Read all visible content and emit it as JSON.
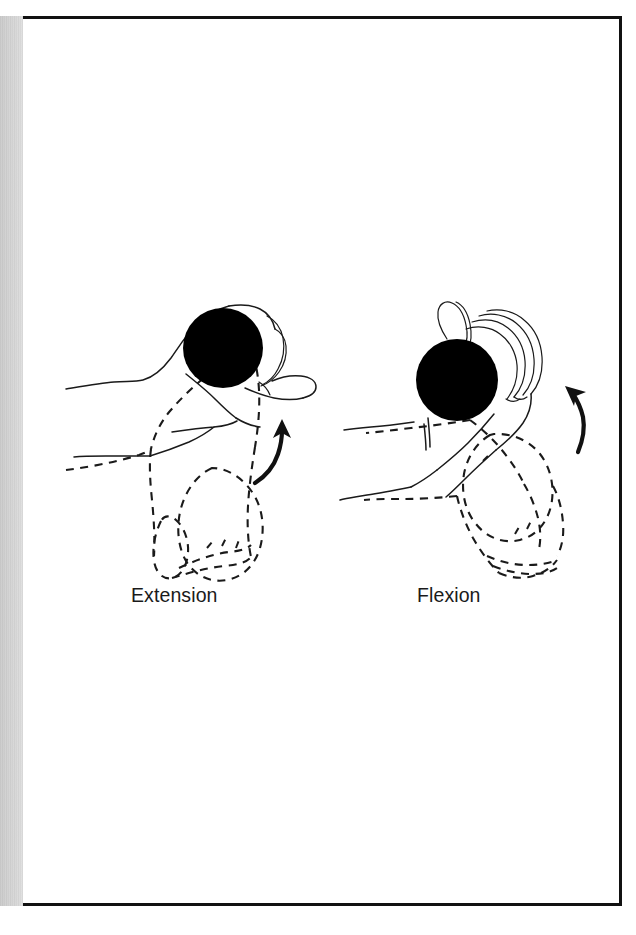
{
  "figure": {
    "kind": "line-drawing-illustration",
    "background_color": "#ffffff",
    "ink_color": "#1a1a1a",
    "frame": {
      "border_color": "#111111",
      "border_width_px": 3
    },
    "scan_artifact": {
      "name": "left-edge-scan-shadow",
      "color": "#d8d8d8"
    }
  },
  "panels": [
    {
      "id": "extension",
      "caption": "Extension",
      "ball": {
        "shape": "circle",
        "fill": "#000000",
        "cx": 223,
        "cy": 348,
        "r": 40
      },
      "solid_outline": "hand and forearm in extended wrist position",
      "dashed_outline": "ghost of hand and forearm in neutral position",
      "arrow": {
        "name": "motion-arrow-up-right",
        "direction": "up-right",
        "color": "#111111"
      }
    },
    {
      "id": "flexion",
      "caption": "Flexion",
      "ball": {
        "shape": "circle",
        "fill": "#000000",
        "cx": 457,
        "cy": 380,
        "r": 41
      },
      "solid_outline": "hand and forearm in flexed wrist position",
      "dashed_outline": "ghost of hand and forearm in neutral position",
      "arrow": {
        "name": "motion-arrow-up-left",
        "direction": "up-left",
        "color": "#111111"
      }
    }
  ]
}
